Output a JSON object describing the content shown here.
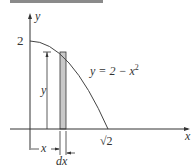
{
  "figure": {
    "curve_equation": "y = 2 − x²",
    "curve_label_prefix": "y = 2 − x",
    "curve_label_exp": "2",
    "y_axis_label": "y",
    "x_axis_label": "x",
    "y_intercept_label": "2",
    "x_intercept_label": "√2",
    "strip_height_label": "y",
    "strip_position_label": "x",
    "strip_width_label": "dx",
    "colors": {
      "axis": "#333333",
      "curve": "#444444",
      "strip_fill": "#c8c8c8",
      "top_bar": "#8a8a8a"
    }
  }
}
